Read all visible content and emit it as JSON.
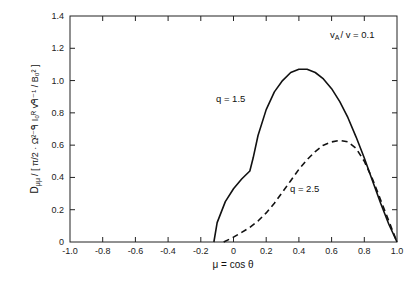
{
  "chart_data": {
    "type": "line",
    "title": "",
    "xlabel": "μ = cos θ",
    "ylabel": "D_μμ / [ (π/2) Ω^(2−q) I_o^R v^(q−1) / B_o^2 ]",
    "xlim": [
      -1.0,
      1.0
    ],
    "ylim": [
      0,
      1.4
    ],
    "grid": false,
    "legend_position": "inline annotations",
    "x_ticks": [
      "-1.0",
      "-0.8",
      "-0.6",
      "-0.4",
      "-0.2",
      "0",
      "0.2",
      "0.4",
      "0.6",
      "0.8",
      "1.0"
    ],
    "y_ticks": [
      "0",
      "0.2",
      "0.4",
      "0.6",
      "0.8",
      "1.0",
      "1.2",
      "1.4"
    ],
    "annotations": [
      "v_A / v = 0.1",
      "q = 1.5",
      "q = 2.5"
    ],
    "series": [
      {
        "name": "q = 1.5",
        "style": "solid",
        "x": [
          -0.12,
          -0.1,
          -0.05,
          0.0,
          0.05,
          0.1,
          0.12,
          0.15,
          0.2,
          0.25,
          0.3,
          0.35,
          0.4,
          0.45,
          0.5,
          0.55,
          0.6,
          0.65,
          0.7,
          0.75,
          0.8,
          0.85,
          0.9,
          0.95,
          1.0
        ],
        "y": [
          0.0,
          0.12,
          0.25,
          0.33,
          0.39,
          0.44,
          0.52,
          0.66,
          0.82,
          0.93,
          1.0,
          1.05,
          1.07,
          1.07,
          1.05,
          1.01,
          0.95,
          0.87,
          0.77,
          0.65,
          0.52,
          0.38,
          0.24,
          0.11,
          0.0
        ]
      },
      {
        "name": "q = 2.5",
        "style": "dashed",
        "x": [
          -0.06,
          0.0,
          0.05,
          0.1,
          0.15,
          0.2,
          0.25,
          0.3,
          0.35,
          0.4,
          0.45,
          0.5,
          0.55,
          0.6,
          0.65,
          0.7,
          0.75,
          0.8,
          0.85,
          0.9,
          0.95,
          1.0
        ],
        "y": [
          0.0,
          0.03,
          0.06,
          0.09,
          0.13,
          0.18,
          0.24,
          0.31,
          0.38,
          0.45,
          0.51,
          0.56,
          0.6,
          0.62,
          0.63,
          0.62,
          0.58,
          0.5,
          0.39,
          0.26,
          0.13,
          0.0
        ]
      }
    ]
  },
  "labels": {
    "ylabel_main": "D",
    "ylabel_sub": "μμ",
    "ylabel_bracket": "/ [ π/2 · Ω²⁻ᑫ I₀ᴿ vᑫ⁻¹ / B₀² ]",
    "xlabel": "μ = cos θ",
    "param": "v",
    "param_sub": "A",
    "param_rest": "/ v = 0.1",
    "series1": "q = 1.5",
    "series2": "q = 2.5"
  }
}
